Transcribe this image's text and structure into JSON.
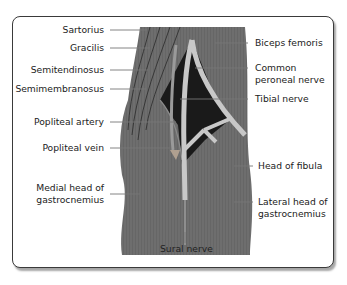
{
  "figure": {
    "colors": {
      "muscle": "#6e6e6e",
      "fossa": "#1a1a1a",
      "nerve": "#c8c8c8",
      "vessel": "#9a9a9a",
      "frame": "#3a3a3a",
      "leader": "#777777"
    },
    "labels_left": [
      {
        "text": "Sartorius"
      },
      {
        "text": "Gracilis"
      },
      {
        "text": "Semitendinosus"
      },
      {
        "text": "Semimembranosus"
      },
      {
        "text": "Popliteal artery"
      },
      {
        "text": "Popliteal vein"
      },
      {
        "line1": "Medial head of",
        "line2": "gastrocnemius"
      }
    ],
    "labels_right": [
      {
        "text": "Biceps femoris"
      },
      {
        "line1": "Common",
        "line2": "peroneal nerve"
      },
      {
        "text": "Tibial nerve"
      },
      {
        "text": "Head of fibula"
      },
      {
        "line1": "Lateral  head of",
        "line2": "gastrocnemius"
      }
    ],
    "label_bottom": {
      "text": "Sural nerve"
    }
  }
}
